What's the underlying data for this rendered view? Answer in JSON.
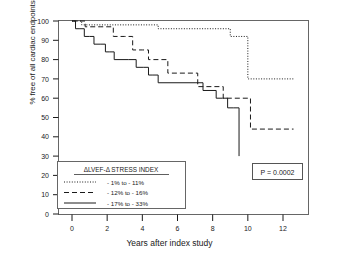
{
  "chart_data": {
    "type": "line",
    "subtype": "kaplan-meier-step",
    "title": "",
    "xlabel": "Years after index study",
    "ylabel": "% free of all cardiac endpoints",
    "xlim": [
      -0.55,
      13.4
    ],
    "ylim": [
      0,
      100
    ],
    "xticks": [
      0,
      2,
      4,
      6,
      8,
      10,
      12
    ],
    "yticks": [
      0,
      10,
      20,
      30,
      40,
      50,
      60,
      70,
      80,
      90,
      100
    ],
    "grid": false,
    "legend_position": "lower-left-inside",
    "legend_title": "ΔLVEF-Δ STRESS INDEX",
    "annotation": "P = 0.0002",
    "series": [
      {
        "name": "- 1% to - 11%",
        "style": "dotted",
        "points": [
          [
            0.0,
            100
          ],
          [
            0.55,
            100
          ],
          [
            0.55,
            98
          ],
          [
            2.0,
            98
          ],
          [
            2.0,
            98
          ],
          [
            4.9,
            98
          ],
          [
            4.9,
            96
          ],
          [
            6.3,
            96
          ],
          [
            6.3,
            96
          ],
          [
            9.0,
            96
          ],
          [
            9.0,
            92
          ],
          [
            10.0,
            92
          ],
          [
            10.0,
            70
          ],
          [
            10.05,
            70
          ],
          [
            10.05,
            70
          ],
          [
            12.6,
            70
          ]
        ]
      },
      {
        "name": "- 12% to - 16%",
        "style": "dashed",
        "points": [
          [
            0.0,
            100
          ],
          [
            0.75,
            100
          ],
          [
            0.75,
            97
          ],
          [
            1.6,
            97
          ],
          [
            1.6,
            97
          ],
          [
            2.35,
            97
          ],
          [
            2.35,
            92
          ],
          [
            3.0,
            92
          ],
          [
            3.0,
            92
          ],
          [
            3.45,
            92
          ],
          [
            3.45,
            85
          ],
          [
            4.0,
            85
          ],
          [
            4.0,
            85
          ],
          [
            4.35,
            85
          ],
          [
            4.35,
            80
          ],
          [
            5.0,
            80
          ],
          [
            5.0,
            80
          ],
          [
            5.45,
            80
          ],
          [
            5.45,
            73
          ],
          [
            6.0,
            73
          ],
          [
            6.0,
            73
          ],
          [
            7.15,
            73
          ],
          [
            7.15,
            66
          ],
          [
            8.0,
            66
          ],
          [
            8.0,
            66
          ],
          [
            8.6,
            66
          ],
          [
            8.6,
            60
          ],
          [
            10.15,
            60
          ],
          [
            10.15,
            44
          ],
          [
            10.2,
            44
          ],
          [
            10.2,
            44
          ],
          [
            12.6,
            44
          ]
        ]
      },
      {
        "name": "- 17% to - 33%",
        "style": "solid",
        "points": [
          [
            0.0,
            100
          ],
          [
            0.2,
            100
          ],
          [
            0.2,
            96
          ],
          [
            0.45,
            96
          ],
          [
            0.45,
            96
          ],
          [
            0.7,
            96
          ],
          [
            0.7,
            92
          ],
          [
            1.0,
            92
          ],
          [
            1.0,
            92
          ],
          [
            1.25,
            92
          ],
          [
            1.25,
            88
          ],
          [
            1.6,
            88
          ],
          [
            1.6,
            88
          ],
          [
            1.9,
            88
          ],
          [
            1.9,
            84
          ],
          [
            2.15,
            84
          ],
          [
            2.15,
            84
          ],
          [
            2.4,
            84
          ],
          [
            2.4,
            80
          ],
          [
            3.2,
            80
          ],
          [
            3.2,
            80
          ],
          [
            3.65,
            80
          ],
          [
            3.65,
            76
          ],
          [
            4.05,
            76
          ],
          [
            4.05,
            76
          ],
          [
            4.35,
            76
          ],
          [
            4.35,
            72
          ],
          [
            4.6,
            72
          ],
          [
            4.6,
            72
          ],
          [
            4.9,
            72
          ],
          [
            4.9,
            68
          ],
          [
            7.05,
            68
          ],
          [
            7.05,
            68
          ],
          [
            7.45,
            68
          ],
          [
            7.45,
            64
          ],
          [
            7.85,
            64
          ],
          [
            7.85,
            64
          ],
          [
            8.2,
            64
          ],
          [
            8.2,
            60
          ],
          [
            8.55,
            60
          ],
          [
            8.55,
            60
          ],
          [
            8.85,
            60
          ],
          [
            8.85,
            55
          ],
          [
            9.2,
            55
          ],
          [
            9.2,
            55
          ],
          [
            9.5,
            55
          ],
          [
            9.5,
            30
          ]
        ]
      }
    ]
  },
  "axes": {
    "ytick_labels": [
      "100",
      "90",
      "80",
      "70",
      "60",
      "50",
      "40",
      "30",
      "20",
      "10",
      "0"
    ],
    "xtick_labels": [
      "0",
      "2",
      "4",
      "6",
      "8",
      "10",
      "12"
    ]
  },
  "legend": {
    "title": "ΔLVEF-Δ STRESS INDEX",
    "items": [
      {
        "label": "- 1% to - 11%",
        "style": "dotted"
      },
      {
        "label": "- 12% to - 16%",
        "style": "dashed"
      },
      {
        "label": "- 17% to - 33%",
        "style": "solid"
      }
    ]
  },
  "pvalue": {
    "text": "P = 0.0002"
  },
  "colors": {
    "ink": "#1a1a1a",
    "frame": "#555555",
    "background": "#ffffff"
  }
}
